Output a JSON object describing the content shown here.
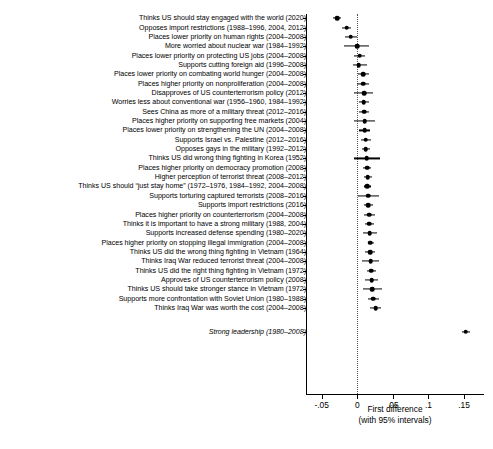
{
  "chart_data": {
    "type": "scatter",
    "title": "",
    "xlabel": "First difference",
    "xlabel_note": "(with 95% intervals)",
    "ylabel": "",
    "xlim": [
      -0.072,
      0.178
    ],
    "xticks": [
      -0.05,
      0,
      0.05,
      0.1,
      0.15
    ],
    "xticklabels": [
      "-.05",
      "0",
      ".05",
      ".1",
      ".15"
    ],
    "grid": false,
    "reference_line": 0,
    "legend": "none",
    "error_bar_type": "95% confidence interval",
    "categories": [
      "Thinks US should stay engaged with the world (2020)",
      "Opposes import restrictions (1988–1996, 2004, 2012)",
      "Places lower priority on human rights (2004–2008)",
      "More worried about nuclear war (1984–1992)",
      "Places lower priority on protecting US jobs (2004–2008)",
      "Supports cutting foreign aid (1996–2008)",
      "Places lower priority on combating world hunger (2004–2008)",
      "Places higher priority on nonproliferation (2004–2008)",
      "Disapproves of US counterterrorism policy (2012)",
      "Worries less about conventional war (1956–1960, 1984–1992)",
      "Sees China as more of a military threat (2012–2016)",
      "Places higher priority on supporting free markets (2004)",
      "Places lower priority on strengthening the UN (2004–2008)",
      "Supports Israel vs. Palestine (2012–2016)",
      "Opposes gays in the military (1992–2012)",
      "Thinks US did wrong thing fighting in Korea (1952)",
      "Places higher priority on democracy promotion (2008)",
      "Higher perception of terrorist threat (2008–2012)",
      "Thinks US should “just stay home” (1972–1976, 1984–1992, 2004–2008)",
      "Supports torturing captured terrorists (2008–2016)",
      "Supports import restrictions (2016)",
      "Places higher priority on counterterrorism (2004–2008)",
      "Thinks it is important to have a strong military (1988, 2004)",
      "Supports increased defense spending (1980–2020)",
      "Places higher priority on stopping illegal immigration (2004–2008)",
      "Thinks US did the wrong thing fighting in Vietnam (1964)",
      "Thinks Iraq War reduced terrorist threat (2004–2008)",
      "Thinks US did the right thing fighting in Vietnam (1972)",
      "Approves of US counterterrorism policy (2008)",
      "Thinks US should take stronger stance in Vietnam (1972)",
      "Supports more confrontation with Soviet Union (1980–1988)",
      "Thinks Iraq War was worth the cost (2004–2008)",
      "Strong leadership (1980–2008)"
    ],
    "points": [
      {
        "label": "Thinks US should stay engaged with the world (2020)",
        "value": -0.0285,
        "lower": -0.0345,
        "upper": -0.0225,
        "italic": false
      },
      {
        "label": "Opposes import restrictions (1988–1996, 2004, 2012)",
        "value": -0.015,
        "lower": -0.0215,
        "upper": -0.0085,
        "italic": false
      },
      {
        "label": "Places lower priority on human rights (2004–2008)",
        "value": -0.0095,
        "lower": -0.0175,
        "upper": -0.001,
        "italic": false
      },
      {
        "label": "More worried about nuclear war (1984–1992)",
        "value": -0.0005,
        "lower": -0.018,
        "upper": 0.017,
        "italic": false
      },
      {
        "label": "Places lower priority on protecting US jobs (2004–2008)",
        "value": 0.0035,
        "lower": -0.0045,
        "upper": 0.0115,
        "italic": false
      },
      {
        "label": "Supports cutting foreign aid (1996–2008)",
        "value": 0.002,
        "lower": -0.006,
        "upper": 0.013,
        "italic": false
      },
      {
        "label": "Places lower priority on combating world hunger (2004–2008)",
        "value": 0.008,
        "lower": 0.0015,
        "upper": 0.0165,
        "italic": false
      },
      {
        "label": "Places higher priority on nonproliferation (2004–2008)",
        "value": 0.008,
        "lower": -0.001,
        "upper": 0.017,
        "italic": false
      },
      {
        "label": "Disapproves of US counterterrorism policy (2012)",
        "value": 0.0095,
        "lower": -0.004,
        "upper": 0.0215,
        "italic": false
      },
      {
        "label": "Worries less about conventional war (1956–1960, 1984–1992)",
        "value": 0.009,
        "lower": 0.003,
        "upper": 0.016,
        "italic": false
      },
      {
        "label": "Sees China as more of a military threat (2012–2016)",
        "value": 0.0095,
        "lower": 0.002,
        "upper": 0.0165,
        "italic": false
      },
      {
        "label": "Places higher priority on supporting free markets (2004)",
        "value": 0.0105,
        "lower": -0.0045,
        "upper": 0.025,
        "italic": false
      },
      {
        "label": "Places lower priority on strengthening the UN (2004–2008)",
        "value": 0.0105,
        "lower": 0.0025,
        "upper": 0.0185,
        "italic": false
      },
      {
        "label": "Supports Israel vs. Palestine (2012–2016)",
        "value": 0.012,
        "lower": 0.0055,
        "upper": 0.019,
        "italic": false
      },
      {
        "label": "Opposes gays in the military (1992–2012)",
        "value": 0.012,
        "lower": 0.006,
        "upper": 0.018,
        "italic": false
      },
      {
        "label": "Thinks US did wrong thing fighting in Korea (1952)",
        "value": 0.0135,
        "lower": -0.0045,
        "upper": 0.032,
        "italic": false
      },
      {
        "label": "Places higher priority on democracy promotion (2008)",
        "value": 0.014,
        "lower": 0.0085,
        "upper": 0.0195,
        "italic": false
      },
      {
        "label": "Higher perception of terrorist threat (2008–2012)",
        "value": 0.0145,
        "lower": 0.009,
        "upper": 0.02,
        "italic": false
      },
      {
        "label": "Thinks US should “just stay home” (1972–1976, 1984–1992, 2004–2008)",
        "value": 0.014,
        "lower": 0.0095,
        "upper": 0.019,
        "italic": false
      },
      {
        "label": "Supports torturing captured terrorists (2008–2016)",
        "value": 0.0155,
        "lower": 0.001,
        "upper": 0.03,
        "italic": false
      },
      {
        "label": "Supports import restrictions (2016)",
        "value": 0.0155,
        "lower": 0.01,
        "upper": 0.0215,
        "italic": false
      },
      {
        "label": "Places higher priority on counterterrorism (2004–2008)",
        "value": 0.017,
        "lower": 0.01,
        "upper": 0.0245,
        "italic": false
      },
      {
        "label": "Thinks it is important to have a strong military (1988, 2004)",
        "value": 0.017,
        "lower": 0.0105,
        "upper": 0.024,
        "italic": false
      },
      {
        "label": "Supports increased defense spending (1980–2020)",
        "value": 0.0175,
        "lower": 0.008,
        "upper": 0.0275,
        "italic": false
      },
      {
        "label": "Places higher priority on stopping illegal immigration (2004–2008)",
        "value": 0.0185,
        "lower": 0.0145,
        "upper": 0.023,
        "italic": false
      },
      {
        "label": "Thinks US did the wrong thing fighting in Vietnam (1964)",
        "value": 0.018,
        "lower": 0.011,
        "upper": 0.0255,
        "italic": false
      },
      {
        "label": "Thinks Iraq War reduced terrorist threat (2004–2008)",
        "value": 0.019,
        "lower": 0.007,
        "upper": 0.031,
        "italic": false
      },
      {
        "label": "Thinks US did the right thing fighting in Vietnam (1972)",
        "value": 0.0195,
        "lower": 0.013,
        "upper": 0.026,
        "italic": false
      },
      {
        "label": "Approves of US counterterrorism policy (2008)",
        "value": 0.02,
        "lower": 0.0115,
        "upper": 0.0285,
        "italic": false
      },
      {
        "label": "Thinks US should take stronger stance in Vietnam (1972)",
        "value": 0.021,
        "lower": 0.0075,
        "upper": 0.0345,
        "italic": false
      },
      {
        "label": "Supports more confrontation with Soviet Union (1980–1988)",
        "value": 0.0225,
        "lower": 0.0155,
        "upper": 0.03,
        "italic": false
      },
      {
        "label": "Thinks Iraq War was worth the cost (2004–2008)",
        "value": 0.026,
        "lower": 0.0185,
        "upper": 0.034,
        "italic": false
      },
      {
        "label": "Strong leadership (1980–2008)",
        "value": 0.1525,
        "lower": 0.1465,
        "upper": 0.1585,
        "italic": true
      }
    ]
  }
}
